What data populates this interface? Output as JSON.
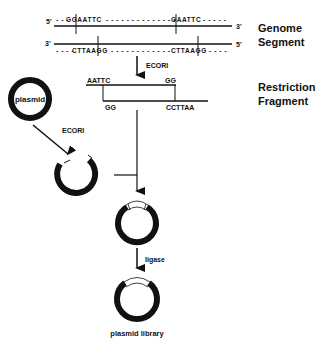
{
  "genome": {
    "label_line1": "Genome",
    "label_line2": "Segment",
    "top_strand": {
      "left_end": "5'",
      "right_end": "3'",
      "site1": "GGAATTC",
      "site2": "GAATTC"
    },
    "bottom_strand": {
      "left_end": "3'",
      "right_end": "5'",
      "site1": "CTTAAGG",
      "site2": "CTTAAGG"
    }
  },
  "digest_top": {
    "enzyme": "ECORI"
  },
  "fragment": {
    "label_line1": "Restriction",
    "label_line2": "Fragment",
    "top_left": "AATTC",
    "top_right": "GG",
    "bottom_left": "GG",
    "bottom_right": "CCTTAA"
  },
  "plasmid": {
    "label": "plasmid"
  },
  "digest_plasmid": {
    "enzyme": "ECORI"
  },
  "ligation": {
    "enzyme": "ligase"
  },
  "result": {
    "label": "plasmid library"
  },
  "colors": {
    "ink": "#111111",
    "background": "#ffffff"
  }
}
